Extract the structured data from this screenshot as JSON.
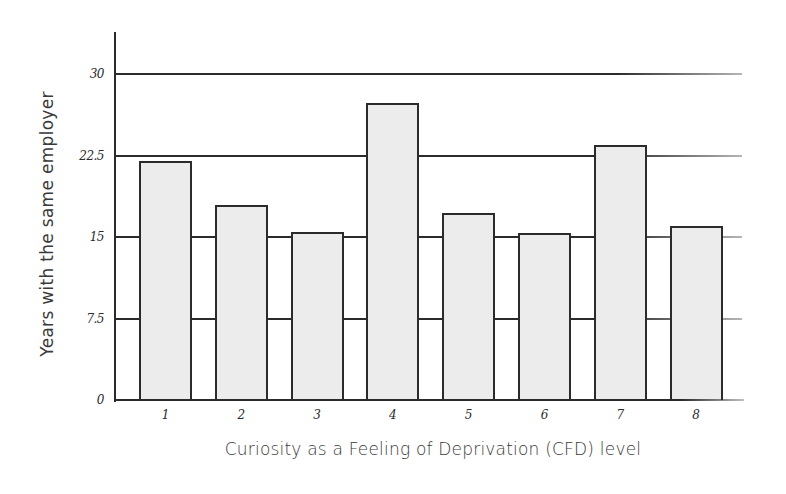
{
  "chart_data": {
    "type": "bar",
    "title": "",
    "xlabel": "Curiosity as a Feeling of Deprivation (CFD) level",
    "ylabel": "Years with the same employer",
    "categories": [
      "1",
      "2",
      "3",
      "4",
      "5",
      "6",
      "7",
      "8"
    ],
    "values": [
      22.0,
      17.9,
      15.5,
      27.3,
      17.2,
      15.4,
      23.5,
      16.0
    ],
    "ylim": [
      0,
      30
    ],
    "yticks": [
      0,
      7.5,
      15,
      22.5,
      30
    ],
    "ytick_labels": [
      "0",
      "7.5",
      "15",
      "22.5",
      "30"
    ],
    "grid": true,
    "legend": null,
    "colors": {
      "bar_fill": "#ececec",
      "bar_edge": "#2b2b2b",
      "grid": "#2b2b2b",
      "text": "#3a3a3a"
    }
  },
  "axes": {
    "x_title": "Curiosity as a Feeling of Deprivation (CFD) level",
    "y_title": "Years with the same employer",
    "y_ticks": [
      "0",
      "7.5",
      "15",
      "22.5",
      "30"
    ],
    "x_ticks": [
      "1",
      "2",
      "3",
      "4",
      "5",
      "6",
      "7",
      "8"
    ]
  }
}
